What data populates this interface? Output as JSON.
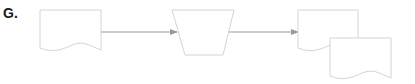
{
  "figure": {
    "label": "G.",
    "colors": {
      "shape_stroke": "#d4d4d4",
      "arrow": "#9a9a9a",
      "label": "#1a1a1a",
      "background": "#ffffff"
    },
    "nodes": [
      {
        "id": "doc-input",
        "shape": "document"
      },
      {
        "id": "manual-operation",
        "shape": "trapezoid"
      },
      {
        "id": "doc-output-1",
        "shape": "document"
      },
      {
        "id": "doc-output-2",
        "shape": "document"
      }
    ],
    "edges": [
      {
        "from": "doc-input",
        "to": "manual-operation"
      },
      {
        "from": "manual-operation",
        "to": "doc-output-1"
      }
    ]
  }
}
